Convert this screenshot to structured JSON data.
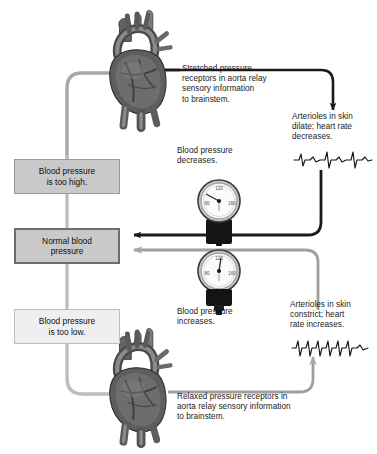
{
  "diagram": {
    "colors": {
      "stimulus_path": "#a8a8a8",
      "response_path": "#1a1a1a",
      "box_fill": "#c9c9c9",
      "box_light_fill": "#efefef",
      "box_border": "#6d6d6d",
      "text": "#111111",
      "background": "#ffffff"
    }
  },
  "boxes": {
    "too_high": "Blood pressure\nis too high.",
    "normal": "Normal blood\npressure",
    "too_low": "Blood pressure\nis too low."
  },
  "labels": {
    "stretched_receptors": "Stretched pressure\nreceptors in aorta relay\nsensory information\nto brainstem.",
    "relaxed_receptors": "Relaxed pressure receptors in\naorta relay sensory information\nto brainstem.",
    "arterioles_dilate": "Arterioles in skin\ndilate; heart rate\ndecreases.",
    "arterioles_constrict": "Arterioles in skin\nconstrict; heart\nrate increases.",
    "bp_decreases": "Blood pressure\ndecreases.",
    "bp_increases": "Blood pressure\nincreases."
  },
  "gauges": [
    {
      "name": "sphygmomanometer-upper",
      "ticks": [
        "120",
        "80",
        "160"
      ],
      "needle_reading": "below normal",
      "caption": "Blood pressure\ndecreases."
    },
    {
      "name": "sphygmomanometer-lower",
      "ticks": [
        "120",
        "80",
        "160"
      ],
      "needle_reading": "above normal",
      "caption": "Blood pressure\nincreases."
    }
  ],
  "organs": [
    {
      "name": "heart-top",
      "description": "Anatomical heart with aorta, stretched receptors"
    },
    {
      "name": "heart-bottom",
      "description": "Anatomical heart with aorta, relaxed receptors"
    }
  ],
  "ecg_traces": [
    {
      "name": "ecg-slow",
      "beats": 4,
      "meaning": "heart rate decreases"
    },
    {
      "name": "ecg-fast",
      "beats": 6,
      "meaning": "heart rate increases"
    }
  ]
}
